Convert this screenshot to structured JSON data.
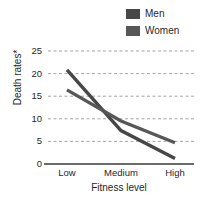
{
  "legend": {
    "position": "top-right",
    "entries": [
      {
        "label": "Men",
        "color": "#474747"
      },
      {
        "label": "Women",
        "color": "#575757"
      }
    ]
  },
  "axis": {
    "y_label": "Death rates*",
    "x_label": "Fitness level",
    "y_ticks": [
      "0",
      "5",
      "10",
      "15",
      "20",
      "25"
    ],
    "x_ticks": [
      "Low",
      "Medium",
      "High"
    ]
  },
  "style": {
    "gridline_color": "#9a9a9a",
    "axis_color": "#3a3a3a",
    "text_color": "#1f1f1f",
    "background": "#ffffff"
  },
  "chart_data": {
    "type": "line",
    "title": "",
    "xlabel": "Fitness level",
    "ylabel": "Death rates*",
    "categories": [
      "Low",
      "Medium",
      "High"
    ],
    "series": [
      {
        "name": "Men",
        "color": "#474747",
        "values": [
          20.8,
          7.4,
          1.2
        ]
      },
      {
        "name": "Women",
        "color": "#575757",
        "values": [
          16.4,
          9.5,
          4.7
        ]
      }
    ],
    "ylim": [
      0,
      25
    ],
    "yticks": [
      0,
      5,
      10,
      15,
      20,
      25
    ],
    "grid": true,
    "grid_style": "dashed",
    "legend": true,
    "legend_position": "top-right"
  }
}
